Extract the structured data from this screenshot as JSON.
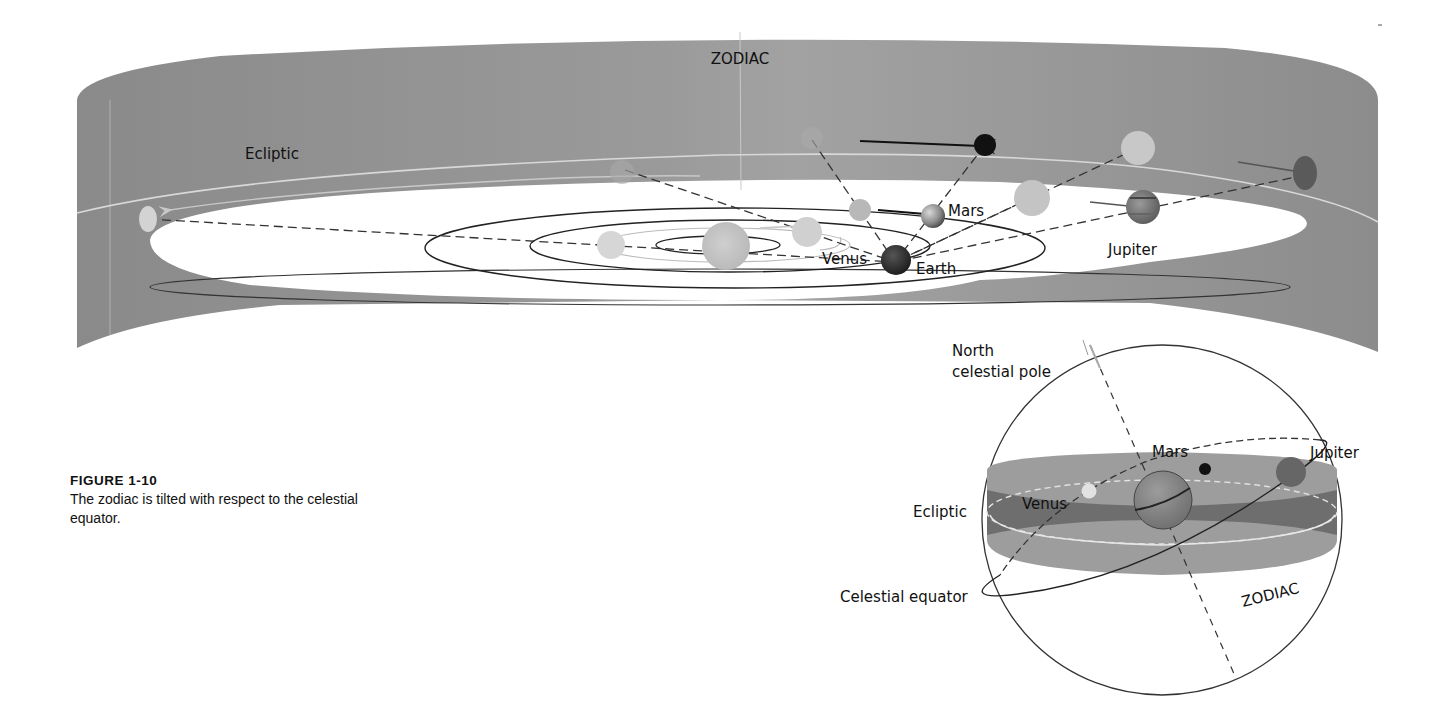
{
  "figure": {
    "number_label": "FIGURE 1-10",
    "caption": "The zodiac is tilted with respect to the celestial equator."
  },
  "top_diagram": {
    "band_label": "ZODIAC",
    "ecliptic_label": "Ecliptic",
    "planets": {
      "venus": "Venus",
      "earth": "Earth",
      "mars": "Mars",
      "jupiter": "Jupiter"
    },
    "colors": {
      "band": "#8e8e8e",
      "band_light": "#a7a7a7",
      "plane": "#ffffff",
      "orbit": "#222222",
      "earth": "#2a2a2a",
      "mars_projected": "#111111"
    }
  },
  "celestial_sphere": {
    "pole_label_line1": "North",
    "pole_label_line2": "celestial pole",
    "ecliptic_label": "Ecliptic",
    "equator_label": "Celestial equator",
    "zodiac_label": "ZODIAC",
    "planets": {
      "mars": "Mars",
      "jupiter": "Jupiter",
      "venus": "Venus"
    }
  }
}
